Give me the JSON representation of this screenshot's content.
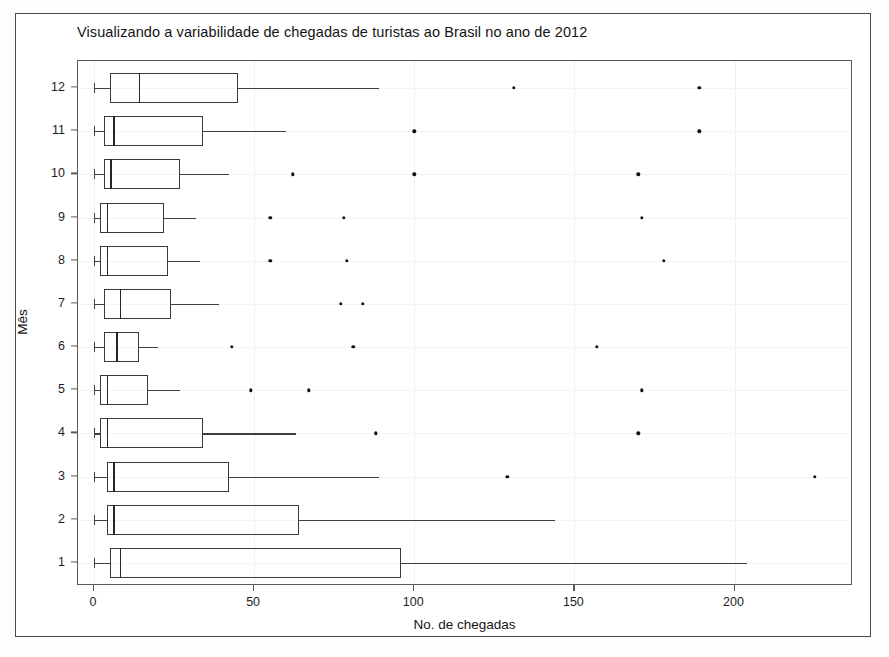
{
  "figure": {
    "title": "Visualizando a variabilidade de chegadas de turistas ao Brasil no ano de 2012",
    "xaxis_title": "No. de chegadas",
    "yaxis_title": "Mês"
  },
  "chart_data": {
    "type": "boxplot",
    "orientation": "horizontal",
    "title": "Visualizando a variabilidade de chegadas de turistas ao Brasil no ano de 2012",
    "xlabel": "No. de chegadas",
    "ylabel": "Mês",
    "xlim": [
      -5,
      237
    ],
    "xticks": [
      0,
      50,
      100,
      150,
      200
    ],
    "xtick_labels": [
      "0",
      "50",
      "100",
      "150",
      "200"
    ],
    "yticks": [
      1,
      2,
      3,
      4,
      5,
      6,
      7,
      8,
      9,
      10,
      11,
      12
    ],
    "ytick_labels": [
      "1",
      "2",
      "3",
      "4",
      "5",
      "6",
      "7",
      "8",
      "9",
      "10",
      "11",
      "12"
    ],
    "grid": true,
    "legend": null,
    "categories": [
      "1",
      "2",
      "3",
      "4",
      "5",
      "6",
      "7",
      "8",
      "9",
      "10",
      "11",
      "12"
    ],
    "boxes": [
      {
        "category": "12",
        "whisker_low": 0,
        "q1": 5,
        "median": 14,
        "q3": 45,
        "whisker_high": 89,
        "outliers": [
          131,
          189
        ]
      },
      {
        "category": "11",
        "whisker_low": 0,
        "q1": 3,
        "median": 6,
        "q3": 34,
        "whisker_high": 60,
        "outliers": [
          100,
          189
        ]
      },
      {
        "category": "10",
        "whisker_low": 0,
        "q1": 3,
        "median": 5,
        "q3": 27,
        "whisker_high": 42,
        "outliers": [
          62,
          100,
          170
        ]
      },
      {
        "category": "9",
        "whisker_low": 0,
        "q1": 2,
        "median": 4,
        "q3": 22,
        "whisker_high": 32,
        "outliers": [
          55,
          78,
          171
        ]
      },
      {
        "category": "8",
        "whisker_low": 0,
        "q1": 2,
        "median": 4,
        "q3": 23,
        "whisker_high": 33,
        "outliers": [
          55,
          79,
          178
        ]
      },
      {
        "category": "7",
        "whisker_low": 0,
        "q1": 3,
        "median": 8,
        "q3": 24,
        "whisker_high": 39,
        "outliers": [
          77,
          84
        ]
      },
      {
        "category": "6",
        "whisker_low": 0,
        "q1": 3,
        "median": 7,
        "q3": 14,
        "whisker_high": 20,
        "outliers": [
          43,
          81,
          157
        ]
      },
      {
        "category": "5",
        "whisker_low": 0,
        "q1": 2,
        "median": 4,
        "q3": 17,
        "whisker_high": 27,
        "outliers": [
          49,
          67,
          171
        ]
      },
      {
        "category": "4",
        "whisker_low": 0,
        "q1": 2,
        "median": 4,
        "q3": 34,
        "whisker_high": 63,
        "outliers": [
          88,
          170
        ]
      },
      {
        "category": "3",
        "whisker_low": 0,
        "q1": 4,
        "median": 6,
        "q3": 42,
        "whisker_high": 89,
        "outliers": [
          129,
          225
        ]
      },
      {
        "category": "2",
        "whisker_low": 0,
        "q1": 4,
        "median": 6,
        "q3": 64,
        "whisker_high": 144,
        "outliers": []
      },
      {
        "category": "1",
        "whisker_low": 0,
        "q1": 5,
        "median": 8,
        "q3": 96,
        "whisker_high": 204,
        "outliers": []
      }
    ]
  }
}
